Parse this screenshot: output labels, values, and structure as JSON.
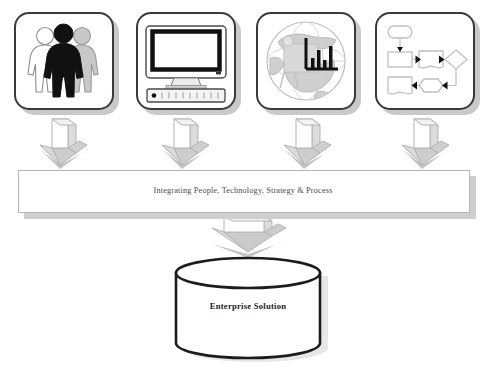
{
  "diagram": {
    "title": "Integrating People, Technology, Strategy & Process",
    "type": "process-convergence-diagram",
    "background_color": "#ffffff",
    "sources": [
      {
        "id": "people",
        "icon": "people-group-icon",
        "alt": "Three human figures standing together, centre figure filled black, left figure white outline, right figure grey",
        "represents": "People"
      },
      {
        "id": "technology",
        "icon": "desktop-computer-icon",
        "alt": "CRT desktop monitor with black bezel resting on a horizontal system unit with indicator light",
        "represents": "Technology"
      },
      {
        "id": "strategy",
        "icon": "globe-bar-chart-icon",
        "alt": "World globe overlaid with a bar chart and an easel",
        "represents": "Strategy"
      },
      {
        "id": "process",
        "icon": "flowchart-icon",
        "alt": "Flowchart with terminator, process boxes, document shapes, decision diamond and hexagon joined by arrows",
        "represents": "Process"
      }
    ],
    "connectors": {
      "source_arrows": {
        "count": 4,
        "icon": "down-block-arrow-icon",
        "direction": "down"
      },
      "banner_arrow": {
        "icon": "down-block-arrow-icon",
        "direction": "down"
      }
    },
    "banner": {
      "text": "Integrating People, Technology, Strategy & Process",
      "fill_color": "#ffffff",
      "border_color": "#b4b4b4",
      "shadow_color": "#cfcfcf",
      "text_color": "#4a4a4a"
    },
    "result": {
      "shape": "cylinder",
      "icon": "database-cylinder-icon",
      "text": "Enterprise Solution",
      "fill_color": "#ffffff",
      "border_color": "#1c1c1c",
      "text_color": "#1c1c1c"
    },
    "palette": {
      "ink": "#3a3a3a",
      "black": "#111111",
      "grey_light": "#d6d6d6",
      "grey_mid": "#b0b0b0",
      "shadow": "#c9c9c9",
      "white": "#ffffff"
    }
  }
}
